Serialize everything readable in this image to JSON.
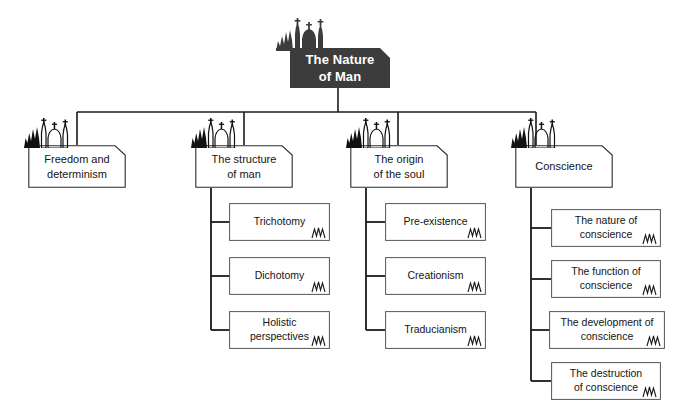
{
  "diagram": {
    "title": "The Nature of Man",
    "type": "hierarchy-tree",
    "background_color": "#ffffff",
    "line_color": "#1a1a1a",
    "root_fill_color": "#3c3c3c",
    "root_text_color": "#ffffff",
    "node_fill_color": "#ffffff",
    "node_border_color": "#2b2b2b",
    "root": {
      "label": "The Nature\nof Man",
      "icon": "church-silhouette-icon"
    },
    "branches": [
      {
        "label": "Freedom and\ndeterminism",
        "icon": "church-outline-icon",
        "children": []
      },
      {
        "label": "The structure\nof man",
        "icon": "church-outline-icon",
        "children": [
          {
            "label": "Trichotomy",
            "mark": "zigzag-mark-icon"
          },
          {
            "label": "Dichotomy",
            "mark": "zigzag-mark-icon"
          },
          {
            "label": "Holistic\nperspectives",
            "mark": "zigzag-mark-icon"
          }
        ]
      },
      {
        "label": "The origin\nof the soul",
        "icon": "church-outline-icon",
        "children": [
          {
            "label": "Pre-existence",
            "mark": "zigzag-mark-icon"
          },
          {
            "label": "Creationism",
            "mark": "zigzag-mark-icon"
          },
          {
            "label": "Traducianism",
            "mark": "zigzag-mark-icon"
          }
        ]
      },
      {
        "label": "Conscience",
        "icon": "church-outline-icon",
        "children": [
          {
            "label": "The nature of\nconscience",
            "mark": "zigzag-mark-icon"
          },
          {
            "label": "The function of\nconscience",
            "mark": "zigzag-mark-icon"
          },
          {
            "label": "The development of\nconscience",
            "mark": "zigzag-mark-icon"
          },
          {
            "label": "The destruction\nof conscience",
            "mark": "zigzag-mark-icon"
          }
        ]
      }
    ]
  }
}
